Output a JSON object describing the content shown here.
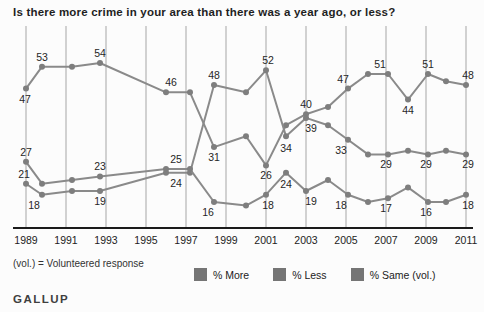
{
  "header": {
    "title": "Is there more crime in your area than there was a year ago, or less?"
  },
  "footnote": {
    "text": "(vol.) = Volunteered response"
  },
  "brand": {
    "text": "GALLUP"
  },
  "legend": {
    "items": [
      "% More",
      "% Less",
      "% Same (vol.)"
    ],
    "swatch_color": "#757575"
  },
  "colors": {
    "background": "#fcfcfc",
    "grid": "#a6a6a6",
    "axis": "#1a1a1a",
    "line": "#8a8a8a",
    "dot": "#7e7e7e",
    "point_label": "#262626",
    "tick_label": "#222222"
  },
  "chart_data": {
    "type": "line",
    "title": "Is there more crime in your area than there was a year ago, or less?",
    "xlabel": "",
    "ylabel": "% of respondents",
    "x_ticks": [
      1989,
      1991,
      1993,
      1995,
      1997,
      1999,
      2001,
      2003,
      2005,
      2007,
      2009,
      2011
    ],
    "x_range": [
      1989,
      2011
    ],
    "ylim": [
      0,
      60
    ],
    "grid": "vertical-only",
    "legend_position": "bottom",
    "series": [
      {
        "name": "% More",
        "points": [
          {
            "x": 1989.0,
            "v": 47,
            "label": "47",
            "pos": "below",
            "dx": -1
          },
          {
            "x": 1989.8,
            "v": 53,
            "label": "53",
            "pos": "above"
          },
          {
            "x": 1991.3,
            "v": 53
          },
          {
            "x": 1992.7,
            "v": 54,
            "label": "54",
            "pos": "above"
          },
          {
            "x": 1996.0,
            "v": 46,
            "label": "46",
            "pos": "above",
            "dx": 5
          },
          {
            "x": 1997.2,
            "v": 46
          },
          {
            "x": 1998.4,
            "v": 31,
            "label": "31",
            "pos": "below"
          },
          {
            "x": 2000.0,
            "v": 34
          },
          {
            "x": 2001.0,
            "v": 26,
            "label": "26",
            "pos": "below"
          },
          {
            "x": 2002.0,
            "v": 37
          },
          {
            "x": 2003.0,
            "v": 40,
            "label": "40",
            "pos": "above"
          },
          {
            "x": 2004.1,
            "v": 42
          },
          {
            "x": 2005.1,
            "v": 47,
            "label": "47",
            "pos": "above",
            "dx": -5
          },
          {
            "x": 2006.1,
            "v": 51
          },
          {
            "x": 2007.1,
            "v": 51,
            "label": "51",
            "pos": "above",
            "dx": -8
          },
          {
            "x": 2008.1,
            "v": 44,
            "label": "44",
            "pos": "below"
          },
          {
            "x": 2009.1,
            "v": 51,
            "label": "51",
            "pos": "above"
          },
          {
            "x": 2010.0,
            "v": 49
          },
          {
            "x": 2011.0,
            "v": 48,
            "label": "48",
            "pos": "above",
            "dx": 2
          }
        ]
      },
      {
        "name": "% Less",
        "points": [
          {
            "x": 1989.0,
            "v": 21,
            "label": "21",
            "pos": "above",
            "dx": -2
          },
          {
            "x": 1989.8,
            "v": 18,
            "label": "18",
            "pos": "below",
            "dx": -8
          },
          {
            "x": 1991.3,
            "v": 19
          },
          {
            "x": 1992.7,
            "v": 19,
            "label": "19",
            "pos": "below"
          },
          {
            "x": 1996.0,
            "v": 24
          },
          {
            "x": 1997.2,
            "v": 24,
            "label": "24",
            "pos": "below",
            "dx": -14
          },
          {
            "x": 1998.4,
            "v": 48,
            "label": "48",
            "pos": "above"
          },
          {
            "x": 2000.0,
            "v": 46
          },
          {
            "x": 2001.0,
            "v": 52,
            "label": "52",
            "pos": "above",
            "dx": 2
          },
          {
            "x": 2002.0,
            "v": 34,
            "label": "34",
            "pos": "below",
            "dy": 2
          },
          {
            "x": 2003.0,
            "v": 39,
            "label": "39",
            "pos": "below",
            "dx": 5
          },
          {
            "x": 2004.1,
            "v": 37
          },
          {
            "x": 2005.1,
            "v": 33,
            "label": "33",
            "pos": "below",
            "dx": -7
          },
          {
            "x": 2006.1,
            "v": 29
          },
          {
            "x": 2007.1,
            "v": 29,
            "label": "29",
            "pos": "below",
            "dx": -2
          },
          {
            "x": 2008.1,
            "v": 30
          },
          {
            "x": 2009.1,
            "v": 29,
            "label": "29",
            "pos": "below",
            "dx": -2
          },
          {
            "x": 2010.0,
            "v": 30
          },
          {
            "x": 2011.0,
            "v": 29,
            "label": "29",
            "pos": "below",
            "dx": 2
          }
        ]
      },
      {
        "name": "% Same (vol.)",
        "points": [
          {
            "x": 1989.0,
            "v": 27,
            "label": "27",
            "pos": "above"
          },
          {
            "x": 1989.8,
            "v": 21
          },
          {
            "x": 1991.3,
            "v": 22
          },
          {
            "x": 1992.7,
            "v": 23,
            "label": "23",
            "pos": "above"
          },
          {
            "x": 1996.0,
            "v": 25
          },
          {
            "x": 1997.2,
            "v": 25,
            "label": "25",
            "pos": "above",
            "dx": -14
          },
          {
            "x": 1998.4,
            "v": 16,
            "label": "16",
            "pos": "below",
            "dx": -6
          },
          {
            "x": 2000.0,
            "v": 15
          },
          {
            "x": 2001.0,
            "v": 18,
            "label": "18",
            "pos": "below",
            "dx": 2
          },
          {
            "x": 2002.0,
            "v": 24,
            "label": "24",
            "pos": "below",
            "dy": 1
          },
          {
            "x": 2003.0,
            "v": 19,
            "label": "19",
            "pos": "below",
            "dx": 5
          },
          {
            "x": 2004.1,
            "v": 22
          },
          {
            "x": 2005.1,
            "v": 18,
            "label": "18",
            "pos": "below",
            "dx": -7
          },
          {
            "x": 2006.1,
            "v": 16
          },
          {
            "x": 2007.1,
            "v": 17,
            "label": "17",
            "pos": "below",
            "dx": -2
          },
          {
            "x": 2008.1,
            "v": 20
          },
          {
            "x": 2009.1,
            "v": 16,
            "label": "16",
            "pos": "below",
            "dx": -2
          },
          {
            "x": 2010.0,
            "v": 16
          },
          {
            "x": 2011.0,
            "v": 18,
            "label": "18",
            "pos": "below",
            "dx": 2
          }
        ]
      }
    ]
  }
}
